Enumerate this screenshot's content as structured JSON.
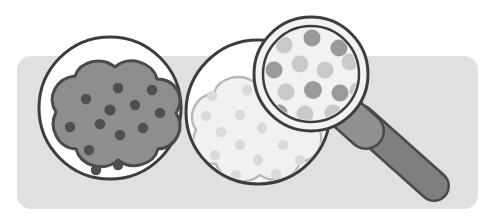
{
  "scene": {
    "title": "Cookie inspection illustration",
    "description": "Two chocolate chip cookies on white plates with a magnifying glass inspecting the second, paler cookie",
    "width": 495,
    "height": 221,
    "background_color": "#ffffff"
  },
  "backdrop": {
    "name": "rounded-panel",
    "color": "#e0e0e0",
    "x": 17,
    "y": 56,
    "width": 461,
    "height": 153,
    "corner_radius": 14
  },
  "plate_left": {
    "label": "Plate with dark cookie",
    "center_x": 110,
    "center_y": 108,
    "radius": 71,
    "fill": "#ffffff",
    "stroke": "#3d3d3d",
    "stroke_width": 3
  },
  "plate_right": {
    "label": "Plate with pale cookie",
    "center_x": 258,
    "center_y": 112,
    "radius": 72,
    "fill": "#ffffff",
    "stroke": "#3d3d3d",
    "stroke_width": 3
  },
  "cookie_dark": {
    "label": "Well baked cookie",
    "fill": "#8e8e8e",
    "stroke": "#4a4a4a",
    "stroke_width": 3,
    "chip_color": "#4f4f4f",
    "chip_count": 13,
    "chips": [
      {
        "cx": 86,
        "cy": 99,
        "r": 5.2
      },
      {
        "cx": 100,
        "cy": 124,
        "r": 5.2
      },
      {
        "cx": 70,
        "cy": 127,
        "r": 5.2
      },
      {
        "cx": 89,
        "cy": 150,
        "r": 5.2
      },
      {
        "cx": 110,
        "cy": 110,
        "r": 5.6
      },
      {
        "cx": 120,
        "cy": 135,
        "r": 5.2
      },
      {
        "cx": 118,
        "cy": 88,
        "r": 5.2
      },
      {
        "cx": 135,
        "cy": 105,
        "r": 5.2
      },
      {
        "cx": 143,
        "cy": 128,
        "r": 5.2
      },
      {
        "cx": 118,
        "cy": 165,
        "r": 5.2
      },
      {
        "cx": 96,
        "cy": 170,
        "r": 5.2
      },
      {
        "cx": 152,
        "cy": 90,
        "r": 5.2
      },
      {
        "cx": 160,
        "cy": 113,
        "r": 5.2
      }
    ]
  },
  "cookie_pale": {
    "label": "Underbaked pale cookie",
    "fill": "#f1f1f1",
    "stroke": "#b8b8b8",
    "stroke_width": 2.4,
    "chip_color": "#dadada",
    "chip_count": 15,
    "chips": [
      {
        "cx": 221,
        "cy": 132,
        "r": 5.2
      },
      {
        "cx": 240,
        "cy": 115,
        "r": 5.2
      },
      {
        "cx": 215,
        "cy": 155,
        "r": 5.2
      },
      {
        "cx": 240,
        "cy": 145,
        "r": 5.2
      },
      {
        "cx": 262,
        "cy": 128,
        "r": 5.2
      },
      {
        "cx": 258,
        "cy": 160,
        "r": 5.2
      },
      {
        "cx": 283,
        "cy": 145,
        "r": 5.2
      },
      {
        "cx": 236,
        "cy": 175,
        "r": 5.2
      },
      {
        "cx": 268,
        "cy": 100,
        "r": 5.2
      },
      {
        "cx": 247,
        "cy": 90,
        "r": 5.2
      },
      {
        "cx": 289,
        "cy": 114,
        "r": 5.2
      },
      {
        "cx": 206,
        "cy": 116,
        "r": 5.2
      },
      {
        "cx": 276,
        "cy": 174,
        "r": 5.2
      },
      {
        "cx": 300,
        "cy": 160,
        "r": 5.2
      },
      {
        "cx": 212,
        "cy": 96,
        "r": 5.2
      }
    ]
  },
  "magnifier": {
    "label": "Magnifying glass",
    "lens_center_x": 311,
    "lens_center_y": 74,
    "outer_radius": 57,
    "inner_radius": 48,
    "rim_fill": "#f2f2f2",
    "rim_stroke": "#3d3d3d",
    "rim_stroke_width": 3,
    "lens_fill": "#f2f2f2",
    "lens_stroke": "#3d3d3d",
    "lens_stroke_width": 2.5,
    "collar_color": "#909090",
    "handle_color": "#7f7f7f",
    "handle_stroke": "#4a4a4a",
    "magnified_chip_dark": "#9a9a9a",
    "magnified_chip_light": "#c9c9c9",
    "magnified_chips": [
      {
        "cx": 284,
        "cy": 45,
        "r": 8.5,
        "tone": "light"
      },
      {
        "cx": 312,
        "cy": 38,
        "r": 8.5,
        "tone": "dark"
      },
      {
        "cx": 339,
        "cy": 48,
        "r": 8.5,
        "tone": "dark"
      },
      {
        "cx": 274,
        "cy": 70,
        "r": 8.5,
        "tone": "dark"
      },
      {
        "cx": 300,
        "cy": 64,
        "r": 8.5,
        "tone": "light"
      },
      {
        "cx": 325,
        "cy": 70,
        "r": 8.5,
        "tone": "light"
      },
      {
        "cx": 350,
        "cy": 62,
        "r": 8.5,
        "tone": "light"
      },
      {
        "cx": 286,
        "cy": 92,
        "r": 8.5,
        "tone": "light"
      },
      {
        "cx": 313,
        "cy": 90,
        "r": 9.0,
        "tone": "dark"
      },
      {
        "cx": 340,
        "cy": 93,
        "r": 8.5,
        "tone": "dark"
      },
      {
        "cx": 279,
        "cy": 113,
        "r": 8.5,
        "tone": "dark"
      },
      {
        "cx": 305,
        "cy": 114,
        "r": 8.5,
        "tone": "light"
      },
      {
        "cx": 333,
        "cy": 113,
        "r": 8.5,
        "tone": "light"
      },
      {
        "cx": 357,
        "cy": 90,
        "r": 7.5,
        "tone": "light"
      },
      {
        "cx": 299,
        "cy": 22,
        "r": 7.0,
        "tone": "light"
      }
    ]
  }
}
